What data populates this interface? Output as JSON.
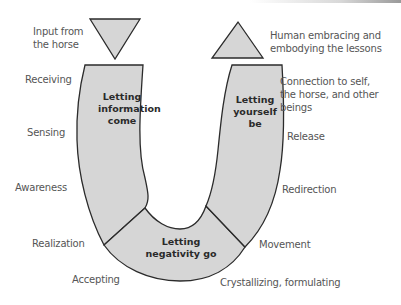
{
  "diagram": {
    "segments": {
      "left": "Letting\ninformation\ncome",
      "bottom": "Letting\nnegativity go",
      "right": "Letting\nyourself\nbe"
    },
    "top_labels": {
      "input": "Input from\nthe horse",
      "output": "Human embracing and\nembodying the lessons"
    },
    "left_labels": [
      "Receiving",
      "Sensing",
      "Awareness",
      "Realization",
      "Accepting"
    ],
    "right_labels": [
      "Connection to self,\n the horse, and other\n beings",
      "Release",
      "Redirection",
      "Movement",
      "Crystallizing, formulating"
    ],
    "colors": {
      "fill": "#d6d6d6",
      "stroke": "#2b2b2b",
      "label": "#555555"
    }
  }
}
